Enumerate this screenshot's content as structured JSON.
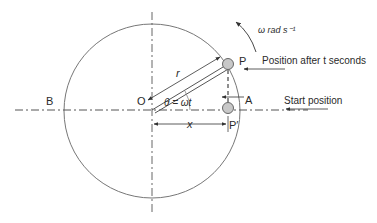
{
  "diagram": {
    "type": "circular-motion-projection",
    "labels": {
      "center": "O",
      "left_point": "B",
      "right_point": "A",
      "moving_point": "P",
      "projected_point": "P′",
      "radius": "r",
      "angle": "θ = ωt",
      "displacement": "x",
      "angular_velocity": "ω rad s⁻¹"
    },
    "annotations": {
      "position_after": "Position after t seconds",
      "start_position": "Start position"
    },
    "colors": {
      "line": "#555555",
      "point_fill": "#c8c8c8",
      "text": "#2a2a2a"
    }
  }
}
